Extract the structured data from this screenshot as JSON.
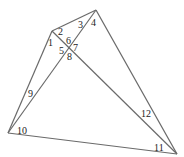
{
  "diagram": {
    "type": "quadrilateral-with-diagonals",
    "vertices": {
      "A": {
        "x": 52,
        "y": 31
      },
      "B": {
        "x": 96,
        "y": 10
      },
      "C": {
        "x": 8,
        "y": 133
      },
      "D": {
        "x": 177,
        "y": 154
      }
    },
    "edges": [
      {
        "from": "A",
        "to": "B"
      },
      {
        "from": "B",
        "to": "D"
      },
      {
        "from": "D",
        "to": "C"
      },
      {
        "from": "C",
        "to": "A"
      },
      {
        "from": "C",
        "to": "B"
      },
      {
        "from": "A",
        "to": "D"
      }
    ],
    "angle_labels": [
      {
        "text": "1",
        "x": 48,
        "y": 46
      },
      {
        "text": "2",
        "x": 58,
        "y": 35
      },
      {
        "text": "3",
        "x": 78,
        "y": 28
      },
      {
        "text": "4",
        "x": 91,
        "y": 26
      },
      {
        "text": "5",
        "x": 59,
        "y": 54
      },
      {
        "text": "6",
        "x": 66,
        "y": 44
      },
      {
        "text": "7",
        "x": 73,
        "y": 51
      },
      {
        "text": "8",
        "x": 67,
        "y": 60
      },
      {
        "text": "9",
        "x": 28,
        "y": 97
      },
      {
        "text": "10",
        "x": 17,
        "y": 134
      },
      {
        "text": "11",
        "x": 154,
        "y": 151
      },
      {
        "text": "12",
        "x": 141,
        "y": 117
      }
    ],
    "stroke_color": "#6a6a6a",
    "label_color": "#222222"
  }
}
